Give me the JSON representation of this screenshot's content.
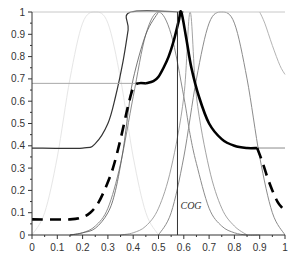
{
  "chart_data": {
    "type": "line",
    "title": "",
    "xlabel": "",
    "ylabel": "",
    "xlim": [
      0,
      1
    ],
    "ylim": [
      0,
      1
    ],
    "grid": false,
    "legend": "none",
    "x_ticks": [
      "0",
      "0.1",
      "0.2",
      "0.3",
      "0.4",
      "0.5",
      "0.6",
      "0.7",
      "0.8",
      "0.9",
      "1"
    ],
    "y_ticks": [
      "0",
      "0.1",
      "0.2",
      "0.3",
      "0.4",
      "0.5",
      "0.6",
      "0.7",
      "0.8",
      "0.9",
      "1"
    ],
    "annotations": [
      {
        "text": "COG",
        "x": 0.575,
        "y": 0.13,
        "type": "vertical-line-label"
      }
    ],
    "vertical_lines": [
      {
        "name": "COG",
        "x": 0.575,
        "y_range": [
          0,
          1
        ]
      }
    ],
    "series": [
      {
        "name": "membership-0.25",
        "style": "very-light-gray-solid",
        "color": "#e6e6e6",
        "x": [
          0.0,
          0.05,
          0.1,
          0.15,
          0.2,
          0.25,
          0.3,
          0.35,
          0.4,
          0.45,
          0.5
        ],
        "y": [
          0.0,
          0.1,
          0.35,
          0.7,
          0.95,
          1.0,
          0.95,
          0.7,
          0.35,
          0.1,
          0.0
        ]
      },
      {
        "name": "membership-0.5",
        "style": "gray-solid",
        "color": "#8c8c8c",
        "x": [
          0.15,
          0.2,
          0.25,
          0.3,
          0.35,
          0.4,
          0.45,
          0.5,
          0.55,
          0.6,
          0.625,
          0.65,
          0.7,
          0.75,
          0.8,
          0.85,
          0.9
        ],
        "y": [
          0.0,
          0.01,
          0.04,
          0.12,
          0.32,
          0.62,
          0.9,
          1.0,
          0.9,
          0.62,
          0.45,
          0.32,
          0.12,
          0.04,
          0.01,
          0.0,
          0.0
        ]
      },
      {
        "name": "membership-0.625-peak",
        "style": "gray-thin-solid",
        "color": "#8c8c8c",
        "x": [
          0.35,
          0.4,
          0.45,
          0.5,
          0.55,
          0.6,
          0.625,
          0.65,
          0.7,
          0.75,
          0.8,
          0.85
        ],
        "y": [
          0.0,
          0.01,
          0.04,
          0.12,
          0.3,
          0.62,
          1.0,
          0.62,
          0.3,
          0.12,
          0.04,
          0.0
        ]
      },
      {
        "name": "membership-0.75",
        "style": "gray-solid",
        "color": "#8c8c8c",
        "x": [
          0.5,
          0.55,
          0.6,
          0.65,
          0.7,
          0.75,
          0.8,
          0.85,
          0.9,
          0.95,
          1.0
        ],
        "y": [
          0.0,
          0.1,
          0.35,
          0.7,
          0.95,
          1.0,
          0.95,
          0.7,
          0.35,
          0.1,
          0.0
        ]
      },
      {
        "name": "membership-1.0",
        "style": "light-gray-solid",
        "color": "#b4b4b4",
        "x": [
          0.9,
          0.92,
          0.95,
          0.98,
          1.0
        ],
        "y": [
          1.0,
          0.95,
          0.85,
          0.76,
          0.72
        ]
      },
      {
        "name": "clipped-0.39-rise",
        "style": "dark-solid",
        "color": "#333333",
        "x": [
          0.0,
          0.2,
          0.25,
          0.3,
          0.33,
          0.36,
          0.38,
          0.39,
          0.6
        ],
        "y": [
          0.39,
          0.39,
          0.41,
          0.5,
          0.62,
          0.78,
          0.92,
          1.0,
          1.0
        ]
      },
      {
        "name": "thin-dark-rise",
        "style": "dark-thin-solid",
        "color": "#555555",
        "x": [
          0.15,
          0.2,
          0.25,
          0.3,
          0.33,
          0.36,
          0.38,
          0.4,
          0.45,
          0.5
        ],
        "y": [
          0.0,
          0.01,
          0.03,
          0.1,
          0.2,
          0.38,
          0.55,
          0.7,
          0.9,
          1.0
        ]
      },
      {
        "name": "cut-line-0.68",
        "style": "light-gray-solid",
        "color": "#a8a8a8",
        "x": [
          0.0,
          0.45
        ],
        "y": [
          0.68,
          0.68
        ]
      },
      {
        "name": "cut-line-0.39",
        "style": "gray-solid",
        "color": "#8c8c8c",
        "x": [
          0.85,
          1.0
        ],
        "y": [
          0.39,
          0.39
        ]
      },
      {
        "name": "top-line-1.0",
        "style": "light-gray-solid",
        "color": "#c8c8c8",
        "x": [
          0.0,
          1.0
        ],
        "y": [
          1.0,
          1.0
        ]
      },
      {
        "name": "aggregate-dashed-left",
        "style": "black-thick-dashed",
        "color": "#000000",
        "x": [
          0.0,
          0.15,
          0.2,
          0.23,
          0.26,
          0.29,
          0.32,
          0.35,
          0.38,
          0.4,
          0.42,
          0.45
        ],
        "y": [
          0.07,
          0.07,
          0.08,
          0.1,
          0.14,
          0.21,
          0.3,
          0.43,
          0.58,
          0.66,
          0.68,
          0.68
        ]
      },
      {
        "name": "aggregate-solid-middle",
        "style": "black-thick-solid",
        "color": "#000000",
        "x": [
          0.45,
          0.48,
          0.5,
          0.52,
          0.54,
          0.56,
          0.58,
          0.59,
          0.61,
          0.63,
          0.66,
          0.7,
          0.75,
          0.8,
          0.85,
          0.89
        ],
        "y": [
          0.68,
          0.69,
          0.71,
          0.75,
          0.8,
          0.87,
          0.96,
          1.0,
          0.88,
          0.75,
          0.62,
          0.5,
          0.43,
          0.4,
          0.39,
          0.39
        ]
      },
      {
        "name": "aggregate-dashed-right",
        "style": "black-thick-dashed",
        "color": "#000000",
        "x": [
          0.89,
          0.91,
          0.93,
          0.95,
          0.97,
          0.99,
          1.0
        ],
        "y": [
          0.39,
          0.33,
          0.26,
          0.2,
          0.15,
          0.12,
          0.11
        ]
      }
    ]
  },
  "axes": {
    "x_tick_labels": [
      "0",
      "0.1",
      "0.2",
      "0.3",
      "0.4",
      "0.5",
      "0.6",
      "0.7",
      "0.8",
      "0.9",
      "1"
    ],
    "y_tick_labels": [
      "0",
      "0.1",
      "0.2",
      "0.3",
      "0.4",
      "0.5",
      "0.6",
      "0.7",
      "0.8",
      "0.9",
      "1"
    ]
  },
  "annotation_cog": "COG"
}
